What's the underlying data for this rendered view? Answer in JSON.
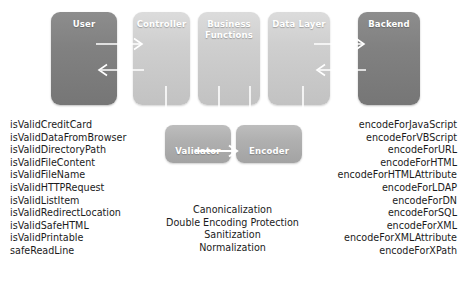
{
  "diagram": {
    "colors": {
      "box_dark": "#818181",
      "box_light": "#cfcfcf",
      "box_mid": "#b0b0b0",
      "arrow": "#ffffff",
      "text": "#1b1b1b",
      "label_text": "#ffffff",
      "background": "#ffffff"
    },
    "layers": [
      {
        "id": "user",
        "label": "User",
        "tone": "dark"
      },
      {
        "id": "controller",
        "label": "Controller",
        "tone": "light"
      },
      {
        "id": "business",
        "label": "Business\nFunctions",
        "line1": "Business",
        "line2": "Functions",
        "tone": "light"
      },
      {
        "id": "datalayer",
        "label": "Data Layer",
        "tone": "light"
      },
      {
        "id": "backend",
        "label": "Backend",
        "tone": "dark"
      }
    ],
    "components": [
      {
        "id": "validator",
        "label": "Validator"
      },
      {
        "id": "encoder",
        "label": "Encoder"
      }
    ],
    "flows": [
      {
        "id": "user-to-controller",
        "direction": "right",
        "from": "User",
        "to": "Controller"
      },
      {
        "id": "controller-to-user",
        "direction": "left",
        "from": "Controller",
        "to": "User"
      },
      {
        "id": "datalayer-to-backend",
        "direction": "right",
        "from": "Data Layer",
        "to": "Backend"
      },
      {
        "id": "backend-to-datalayer",
        "direction": "left",
        "from": "Backend",
        "to": "Data Layer"
      },
      {
        "id": "validator-to-encoder",
        "direction": "right",
        "from": "Validator",
        "to": "Encoder"
      },
      {
        "id": "controller-to-validator-a",
        "direction": "down",
        "from": "Controller",
        "to": "Validator"
      },
      {
        "id": "business-to-validator-b",
        "direction": "down",
        "from": "Business Functions",
        "to": "Validator"
      },
      {
        "id": "business-to-encoder-a",
        "direction": "down",
        "from": "Business Functions",
        "to": "Encoder"
      },
      {
        "id": "datalayer-to-encoder-b",
        "direction": "down",
        "from": "Data Layer",
        "to": "Encoder"
      }
    ],
    "validator_methods": [
      "isValidCreditCard",
      "isValidDataFromBrowser",
      "isValidDirectoryPath",
      "isValidFileContent",
      "isValidFileName",
      "isValidHTTPRequest",
      "isValidListItem",
      "isValidRedirectLocation",
      "isValidSafeHTML",
      "isValidPrintable",
      "safeReadLine"
    ],
    "encoder_methods": [
      "encodeForJavaScript",
      "encodeForVBScript",
      "encodeForURL",
      "encodeForHTML",
      "encodeForHTMLAttribute",
      "encodeForLDAP",
      "encodeForDN",
      "encodeForSQL",
      "encodeForXML",
      "encodeForXMLAttribute",
      "encodeForXPath"
    ],
    "center_features": [
      "Canonicalization",
      "Double Encoding Protection",
      "Sanitization",
      "Normalization"
    ]
  }
}
